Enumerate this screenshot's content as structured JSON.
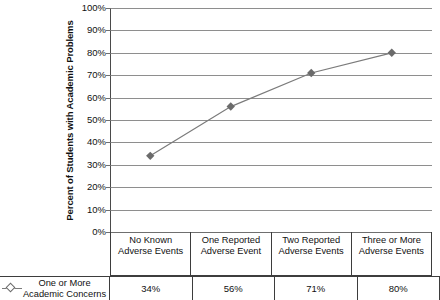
{
  "chart_data": {
    "type": "line",
    "title": "",
    "xlabel": "",
    "ylabel": "Percent of Students with Academic Problems",
    "ylim": [
      0,
      100
    ],
    "ytick_labels": [
      "100%",
      "90%",
      "80%",
      "70%",
      "60%",
      "50%",
      "40%",
      "30%",
      "20%",
      "10%",
      "0%"
    ],
    "ytick_values": [
      100,
      90,
      80,
      70,
      60,
      50,
      40,
      30,
      20,
      10,
      0
    ],
    "grid": true,
    "legend_position": "bottom-left",
    "categories": [
      "No Known Adverse Events",
      "One Reported Adverse Event",
      "Two Reported Adverse Events",
      "Three or More Adverse Events"
    ],
    "category_lines": [
      [
        "No Known",
        "Adverse Events"
      ],
      [
        "One Reported",
        "Adverse Event"
      ],
      [
        "Two Reported",
        "Adverse Events"
      ],
      [
        "Three or More",
        "Adverse Events"
      ]
    ],
    "series": [
      {
        "name": "One or More Academic Concerns",
        "name_lines": [
          "One or More",
          "Academic Concerns"
        ],
        "values": [
          34,
          56,
          71,
          80
        ],
        "value_labels": [
          "34%",
          "56%",
          "71%",
          "80%"
        ],
        "marker": "diamond",
        "line_color": "#7b7b7b",
        "marker_color": "#6b6b6b"
      }
    ]
  },
  "colors": {
    "line": "#7b7b7b",
    "marker": "#6b6b6b",
    "gridline": "#8e8e8e",
    "axis": "#4a4a4a",
    "table_border": "#3d3d3d",
    "text": "#111111",
    "background": "#ffffff"
  }
}
